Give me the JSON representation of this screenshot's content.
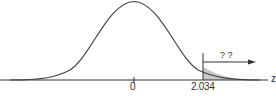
{
  "diagram": {
    "type": "normal-distribution-right-tail",
    "axis_label": "z",
    "center_tick_label": "0",
    "cutoff_label": "2.034",
    "tail_annotation": "? ?",
    "shaded_region": "right tail beyond 2.034",
    "colors": {
      "curve": "#444444",
      "axis": "#333333",
      "shade": "#c8c8c8"
    }
  }
}
